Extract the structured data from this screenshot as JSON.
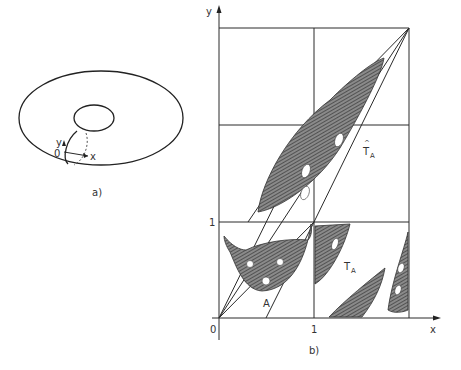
{
  "figure": {
    "panel_a": {
      "caption": "a)",
      "description": "torus with local coordinate frame",
      "origin_label": "0",
      "x_label": "x",
      "y_label": "y"
    },
    "panel_b": {
      "caption": "b)",
      "x_axis_label": "x",
      "y_axis_label": "y",
      "x_ticks": [
        "0",
        "1"
      ],
      "y_ticks": [
        "1"
      ],
      "region_label": "A",
      "image_label_main": "T",
      "image_label_sub": "A",
      "lifted_label_main": "T",
      "lifted_label_hat": "^",
      "lifted_label_sub": "A"
    },
    "colors": {
      "line": "#2a2a2a",
      "shade": "#6e6e6e",
      "background": "#ffffff"
    }
  }
}
